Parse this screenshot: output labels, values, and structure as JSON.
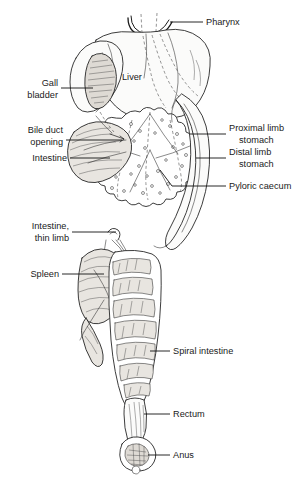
{
  "figure": {
    "style": "pen-and-ink line drawing",
    "background_color": "#ffffff",
    "ink_color": "#1a1a1a"
  },
  "labels": {
    "pharynx": "Pharynx",
    "liver": "Liver",
    "gall_bladder_line1": "Gall",
    "gall_bladder_line2": "bladder",
    "bile_duct_line1": "Bile duct",
    "bile_duct_line2": "opening",
    "intestine": "Intestine",
    "proximal_line1": "Proximal limb",
    "proximal_line2": "stomach",
    "distal_line1": "Distal limb",
    "distal_line2": "stomach",
    "pyloric_caecum": "Pyloric caecum",
    "intestine_thin_line1": "Intestine,",
    "intestine_thin_line2": "thin limb",
    "spleen": "Spleen",
    "spiral_intestine": "Spiral intestine",
    "rectum": "Rectum",
    "anus": "Anus"
  }
}
